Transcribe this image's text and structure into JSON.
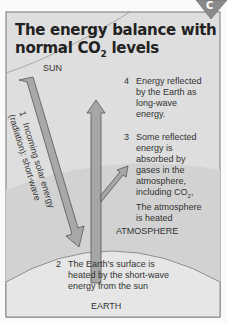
{
  "badge": {
    "letter": "C"
  },
  "title": {
    "line1": "The energy balance with",
    "line2_prefix": "normal CO",
    "line2_sub": "2",
    "line2_suffix": " levels"
  },
  "labels": {
    "sun": "SUN",
    "atmosphere": "ATMOSPHERE",
    "earth": "EARTH"
  },
  "steps": [
    {
      "number": "1",
      "text": "Incoming solar energy (radiation): short-wave"
    },
    {
      "number": "2",
      "lines": [
        "The Earth's surface is",
        "heated by the short-wave",
        "energy from the sun"
      ]
    },
    {
      "number": "3",
      "lines": [
        "Some reflected",
        "energy is",
        "absorbed by",
        "gases in the",
        "atmosphere,",
        "including CO",
        "The atmosphere",
        "is heated"
      ],
      "sub": "2",
      "sub_after": ","
    },
    {
      "number": "4",
      "lines": [
        "Energy reflected",
        "by the Earth as",
        "long-wave",
        "energy."
      ]
    }
  ],
  "step1_rotated": {
    "line1": "Incoming solar energy",
    "line2": "(radiation): short-wave"
  },
  "colors": {
    "frame_bg": "#dcdcdc",
    "atmosphere": "#cfcfcf",
    "earth": "#e4e4e4",
    "arrow": "#a9a9a9",
    "arrow_stroke": "#555555",
    "badge": "#8a8a8a"
  }
}
